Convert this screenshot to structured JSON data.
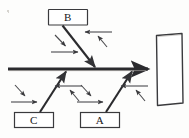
{
  "document": {
    "kind": "fishbone-diagram",
    "title": "Cause and effect (Ishikawa) diagram",
    "background_color": "#fdfdfc",
    "ink_color": "#2b2b2e"
  },
  "diagram": {
    "spine": {
      "name": "main-spine-arrow",
      "from": [
        8,
        69
      ],
      "to": [
        152,
        69
      ],
      "direction": "right",
      "stroke_width": 3
    },
    "effect_box": {
      "name": "effect-box",
      "label": "",
      "x": 155,
      "y": 33,
      "width": 28,
      "height": 72,
      "tilt_deg": 2
    },
    "branches": [
      {
        "id": "b",
        "label": "B",
        "side": "top",
        "box": {
          "x": 48,
          "y": 9,
          "width": 40,
          "height": 16
        },
        "line_from": [
          62,
          25
        ],
        "line_to": [
          96,
          69
        ],
        "arrowhead": "at-spine",
        "sub_arrows": [
          {
            "name": "sub-arrow-b-left-diagonal",
            "from": [
              56,
              36
            ],
            "to": [
              66,
              47
            ],
            "type": "diagonal"
          },
          {
            "name": "sub-arrow-b-left-horizontal",
            "from": [
              52,
              52
            ],
            "to": [
              80,
              52
            ],
            "type": "horizontal-right"
          },
          {
            "name": "sub-arrow-b-right-horizontal",
            "from": [
              110,
              32
            ],
            "to": [
              84,
              32
            ],
            "type": "horizontal-left"
          },
          {
            "name": "sub-arrow-b-right-diagonal",
            "from": [
              106,
              46
            ],
            "to": [
              98,
              36
            ],
            "type": "diagonal"
          }
        ]
      },
      {
        "id": "c",
        "label": "C",
        "side": "bottom",
        "box": {
          "x": 14,
          "y": 112,
          "width": 40,
          "height": 16
        },
        "line_from": [
          40,
          112
        ],
        "line_to": [
          65,
          69
        ],
        "arrowhead": "at-spine",
        "sub_arrows": [
          {
            "name": "sub-arrow-c-left-diagonal",
            "from": [
              16,
              86
            ],
            "to": [
              26,
              97
            ],
            "type": "diagonal"
          },
          {
            "name": "sub-arrow-c-left-horizontal",
            "from": [
              12,
              102
            ],
            "to": [
              38,
              102
            ],
            "type": "horizontal-right"
          },
          {
            "name": "sub-arrow-c-right-horizontal",
            "from": [
              80,
              86
            ],
            "to": [
              54,
              86
            ],
            "type": "horizontal-left"
          },
          {
            "name": "sub-arrow-c-right-diagonal",
            "from": [
              78,
              99
            ],
            "to": [
              70,
              90
            ],
            "type": "diagonal"
          }
        ]
      },
      {
        "id": "a",
        "label": "A",
        "side": "bottom",
        "box": {
          "x": 80,
          "y": 112,
          "width": 40,
          "height": 16
        },
        "line_from": [
          106,
          112
        ],
        "line_to": [
          131,
          69
        ],
        "arrowhead": "at-spine",
        "sub_arrows": [
          {
            "name": "sub-arrow-a-left-diagonal",
            "from": [
              82,
              86
            ],
            "to": [
              92,
              97
            ],
            "type": "diagonal"
          },
          {
            "name": "sub-arrow-a-left-horizontal",
            "from": [
              78,
              102
            ],
            "to": [
              104,
              102
            ],
            "type": "horizontal-right"
          },
          {
            "name": "sub-arrow-a-right-horizontal",
            "from": [
              146,
              86
            ],
            "to": [
              120,
              86
            ],
            "type": "horizontal-left"
          },
          {
            "name": "sub-arrow-a-right-diagonal",
            "from": [
              144,
              99
            ],
            "to": [
              136,
              90
            ],
            "type": "diagonal"
          }
        ]
      }
    ],
    "artifacts": [
      {
        "name": "scan-speck",
        "x": 7,
        "y": 10
      }
    ]
  }
}
